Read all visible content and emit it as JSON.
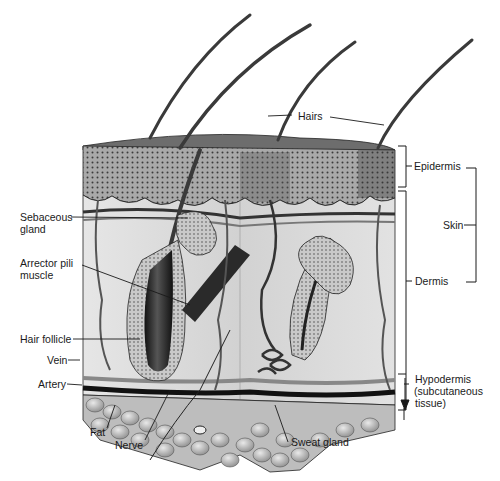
{
  "diagram": {
    "labels": {
      "hairs": "Hairs",
      "epidermis": "Epidermis",
      "skin": "Skin",
      "dermis": "Dermis",
      "hypodermis_line1": "Hypodermis",
      "hypodermis_line2": "(subcutaneous",
      "hypodermis_line3": "tissue)",
      "sebaceous_line1": "Sebaceous",
      "sebaceous_line2": "gland",
      "arrector_line1": "Arrector pili",
      "arrector_line2": "muscle",
      "hair_follicle": "Hair follicle",
      "vein": "Vein",
      "artery": "Artery",
      "fat": "Fat",
      "nerve": "Nerve",
      "sweat_gland": "Sweat gland"
    },
    "colors": {
      "ink": "#1a1a1a",
      "epidermis": "#7a7a7a",
      "dermis": "#d8d8d8",
      "fat": "#bdbdbd",
      "hair": "#3a3a3a"
    }
  }
}
